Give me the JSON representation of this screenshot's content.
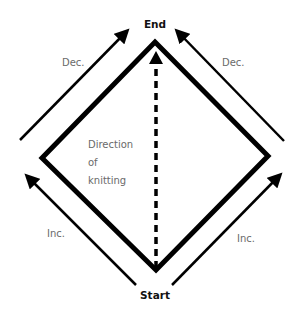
{
  "labels": {
    "end": "End",
    "start": "Start",
    "dec_left": "Dec.",
    "dec_right": "Dec.",
    "inc_left": "Inc.",
    "inc_right": "Inc.",
    "direction_line1": "Direction",
    "direction_line2": "of",
    "direction_line3": "knitting"
  },
  "colors": {
    "stroke": "#000000",
    "label": "#6a6a6a",
    "background": "#ffffff"
  }
}
